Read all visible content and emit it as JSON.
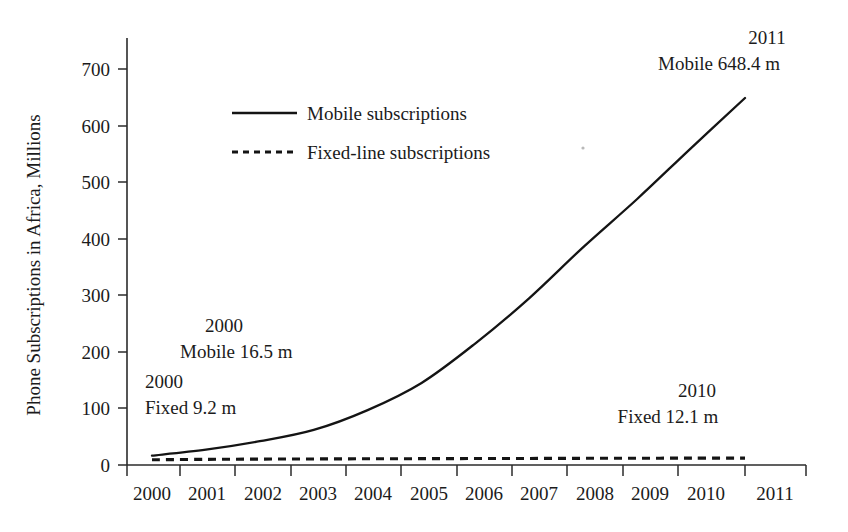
{
  "chart_data": {
    "type": "line",
    "title": "",
    "subtitle": "",
    "xlabel": "",
    "ylabel": "Phone Subscriptions in Africa, Millions",
    "x": [
      2000,
      2001,
      2002,
      2003,
      2004,
      2005,
      2006,
      2007,
      2008,
      2009,
      2010,
      2011
    ],
    "xtick_labels": [
      "2000",
      "2001",
      "2002",
      "2003",
      "2004",
      "2005",
      "2006",
      "2007",
      "2008",
      "2009",
      "2010",
      "2011"
    ],
    "ytick_labels": [
      "0",
      "100",
      "200",
      "300",
      "400",
      "500",
      "600",
      "700"
    ],
    "ytick_values": [
      0,
      100,
      200,
      300,
      400,
      500,
      600,
      700
    ],
    "xlim": [
      2000,
      2011
    ],
    "ylim": [
      0,
      740
    ],
    "grid": false,
    "legend_position": "upper-left-inside",
    "series": [
      {
        "name": "Mobile subscriptions",
        "style": "solid",
        "color": "#141414",
        "values": [
          16.5,
          27,
          42,
          62,
          97,
          145,
          215,
          295,
          385,
          470,
          560,
          648.4
        ]
      },
      {
        "name": "Fixed-line subscriptions",
        "style": "dashed",
        "color": "#141414",
        "values": [
          9.2,
          10.0,
          10.4,
          10.7,
          11.0,
          11.2,
          11.4,
          11.6,
          11.8,
          12.0,
          12.1,
          12.1
        ]
      }
    ],
    "annotations": [
      {
        "id": "fixed-2000",
        "line1": "2000",
        "line2": "Fixed 9.2 m",
        "x": 2000,
        "value": 9.2
      },
      {
        "id": "mobile-2000",
        "line1": "2000",
        "line2": "Mobile 16.5 m",
        "x": 2000,
        "value": 16.5
      },
      {
        "id": "mobile-2011",
        "line1": "2011",
        "line2": "Mobile 648.4 m",
        "x": 2011,
        "value": 648.4
      },
      {
        "id": "fixed-2010",
        "line1": "2010",
        "line2": "Fixed 12.1 m",
        "x": 2010,
        "value": 12.1
      }
    ]
  }
}
